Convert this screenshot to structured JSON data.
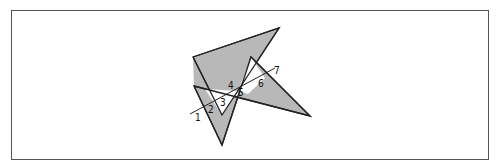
{
  "diagram": {
    "colors": {
      "fill": "#b8b8b8",
      "stroke": "#222222",
      "frame": "#555555",
      "background": "#ffffff"
    },
    "polygons": [
      {
        "name": "upper-polygon",
        "points": [
          [
            193,
            57
          ],
          [
            279,
            28
          ],
          [
            222,
            115
          ],
          [
            251,
            57
          ],
          [
            310,
            116
          ],
          [
            194,
            86
          ],
          [
            223,
            145
          ]
        ]
      }
    ],
    "line": {
      "from": [
        190,
        114
      ],
      "to": [
        275,
        68
      ]
    },
    "labels": [
      {
        "id": "1",
        "text": "1",
        "x": 195,
        "y": 121
      },
      {
        "id": "2",
        "text": "2",
        "x": 208,
        "y": 113
      },
      {
        "id": "3",
        "text": "3",
        "x": 220,
        "y": 106
      },
      {
        "id": "4",
        "text": "4",
        "x": 228,
        "y": 89
      },
      {
        "id": "5",
        "text": "5",
        "x": 238,
        "y": 96
      },
      {
        "id": "6",
        "text": "6",
        "x": 258,
        "y": 87
      },
      {
        "id": "7",
        "text": "7",
        "x": 274,
        "y": 74
      }
    ]
  }
}
